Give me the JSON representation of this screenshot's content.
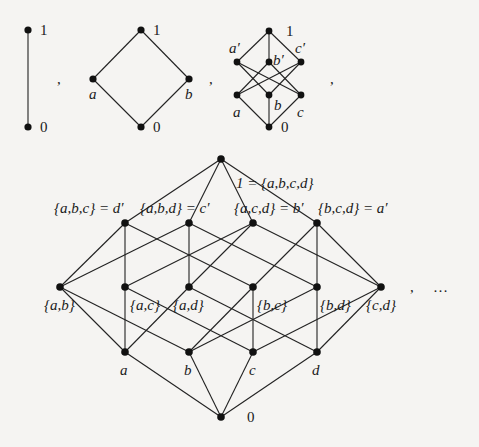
{
  "diagrams": {
    "chain": {
      "nodes": [
        {
          "id": "1",
          "label": "1",
          "x": 28,
          "y": 30
        },
        {
          "id": "0",
          "label": "0",
          "x": 28,
          "y": 127
        }
      ],
      "edges": [
        [
          "0",
          "1"
        ]
      ]
    },
    "diamond": {
      "nodes": [
        {
          "id": "1",
          "label": "1",
          "x": 141,
          "y": 30
        },
        {
          "id": "a",
          "label": "a",
          "x": 93,
          "y": 79
        },
        {
          "id": "b",
          "label": "b",
          "x": 189,
          "y": 79
        },
        {
          "id": "0",
          "label": "0",
          "x": 141,
          "y": 127
        }
      ],
      "edges": [
        [
          "0",
          "a"
        ],
        [
          "0",
          "b"
        ],
        [
          "a",
          "1"
        ],
        [
          "b",
          "1"
        ]
      ]
    },
    "cube": {
      "nodes": [
        {
          "id": "1",
          "label": "1",
          "x": 269,
          "y": 31
        },
        {
          "id": "a'",
          "label": "a'",
          "x": 237,
          "y": 62
        },
        {
          "id": "b'",
          "label": "b'",
          "x": 269,
          "y": 62
        },
        {
          "id": "c'",
          "label": "c'",
          "x": 301,
          "y": 62
        },
        {
          "id": "a",
          "label": "a",
          "x": 237,
          "y": 95
        },
        {
          "id": "b",
          "label": "b",
          "x": 269,
          "y": 95
        },
        {
          "id": "c",
          "label": "c",
          "x": 301,
          "y": 95
        },
        {
          "id": "0",
          "label": "0",
          "x": 269,
          "y": 127
        }
      ],
      "edges": [
        [
          "0",
          "a"
        ],
        [
          "0",
          "b"
        ],
        [
          "0",
          "c"
        ],
        [
          "a'",
          "1"
        ],
        [
          "b'",
          "1"
        ],
        [
          "c'",
          "1"
        ],
        [
          "a",
          "b'"
        ],
        [
          "a",
          "c'"
        ],
        [
          "b",
          "a'"
        ],
        [
          "b",
          "c'"
        ],
        [
          "c",
          "a'"
        ],
        [
          "c",
          "b'"
        ]
      ]
    },
    "hypercube": {
      "top_label": "1 = {a,b,c,d}",
      "bottom_label": "0",
      "nodes": [
        {
          "id": "abcd",
          "label": "1 = {a,b,c,d}",
          "x": 221,
          "y": 159
        },
        {
          "id": "abc",
          "label": "{a,b,c} = d'",
          "x": 125,
          "y": 223
        },
        {
          "id": "abd",
          "label": "{a,b,d} = c'",
          "x": 189,
          "y": 223
        },
        {
          "id": "acd",
          "label": "{a,c,d} = b'",
          "x": 253,
          "y": 223
        },
        {
          "id": "bcd",
          "label": "{b,c,d} = a'",
          "x": 317,
          "y": 223
        },
        {
          "id": "ab",
          "label": "{a,b}",
          "x": 60,
          "y": 287
        },
        {
          "id": "ac",
          "label": "{a,c}",
          "x": 125,
          "y": 287
        },
        {
          "id": "ad",
          "label": "{a,d}",
          "x": 189,
          "y": 287
        },
        {
          "id": "bc",
          "label": "{b,c}",
          "x": 253,
          "y": 287
        },
        {
          "id": "bd",
          "label": "{b,d}",
          "x": 317,
          "y": 287
        },
        {
          "id": "cd",
          "label": "{c,d}",
          "x": 381,
          "y": 287
        },
        {
          "id": "a",
          "label": "a",
          "x": 125,
          "y": 352
        },
        {
          "id": "b",
          "label": "b",
          "x": 189,
          "y": 352
        },
        {
          "id": "c",
          "label": "c",
          "x": 253,
          "y": 352
        },
        {
          "id": "d",
          "label": "d",
          "x": 317,
          "y": 352
        },
        {
          "id": "0",
          "label": "0",
          "x": 221,
          "y": 417
        }
      ]
    }
  },
  "separators": [
    ",",
    ",",
    ",",
    ", …"
  ],
  "labels": {
    "chain_top": "1",
    "chain_bottom": "0",
    "diamond_top": "1",
    "diamond_a": "a",
    "diamond_b": "b",
    "diamond_bottom": "0",
    "cube_top": "1",
    "cube_ap": "a′",
    "cube_bp": "b′",
    "cube_cp": "c′",
    "cube_a": "a",
    "cube_b": "b",
    "cube_c": "c",
    "cube_bottom": "0",
    "h_top": "1 = {a,b,c,d}",
    "h_abc": "{a,b,c} = d′",
    "h_abd": "{a,b,d} = c′",
    "h_acd": "{a,c,d} = b′",
    "h_bcd": "{b,c,d} = a′",
    "h_ab": "{a,b}",
    "h_ac": "{a,c}",
    "h_ad": "{a,d}",
    "h_bc": "{b,c}",
    "h_bd": "{b,d}",
    "h_cd": "{c,d}",
    "h_a": "a",
    "h_b": "b",
    "h_c": "c",
    "h_d": "d",
    "h_bottom": "0",
    "comma1": ",",
    "comma2": ",",
    "comma3": ",",
    "comma4": ",",
    "ellipsis": "…"
  }
}
